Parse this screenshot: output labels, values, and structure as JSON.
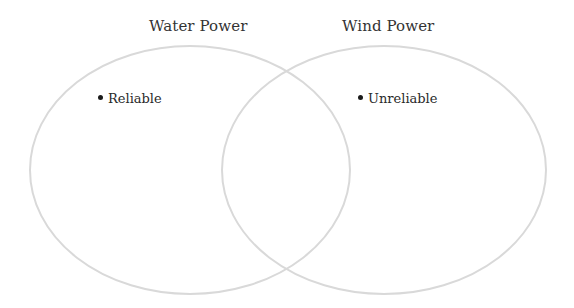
{
  "diagram": {
    "type": "venn",
    "sets": [
      {
        "id": "water",
        "title": "Water Power",
        "items": [
          "Reliable"
        ]
      },
      {
        "id": "wind",
        "title": "Wind Power",
        "items": [
          "Unreliable"
        ]
      }
    ],
    "overlap_items": [],
    "circle_stroke_color": "#d9d9d9",
    "bullet_color": "#1a1a1a",
    "text_color": "#333333"
  }
}
